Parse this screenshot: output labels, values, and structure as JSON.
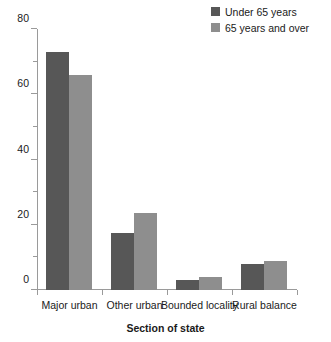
{
  "chart_data": {
    "type": "bar",
    "title": "",
    "xlabel": "Section of state",
    "ylabel": "",
    "categories": [
      "Major urban",
      "Other urban",
      "Bounded locality",
      "Rural balance"
    ],
    "series": [
      {
        "name": "Under 65 years",
        "color": "#575757",
        "values": [
          73,
          17.5,
          3,
          8
        ]
      },
      {
        "name": "65 years and over",
        "color": "#8e8e8e",
        "values": [
          66,
          23.5,
          4,
          9
        ]
      }
    ],
    "ylim": [
      0,
      80
    ],
    "yticks": [
      0,
      20,
      40,
      60,
      80
    ],
    "ytick_labels": [
      "0",
      "20",
      "40",
      "60",
      "80"
    ],
    "yminor_ticks": [
      10,
      30,
      50,
      70
    ],
    "grid": false,
    "legend_position": "top-right"
  },
  "legend": {
    "items": [
      {
        "label": "Under 65 years",
        "color": "#575757"
      },
      {
        "label": "65 years and over",
        "color": "#8e8e8e"
      }
    ]
  },
  "axis": {
    "x_title": "Section of state"
  }
}
